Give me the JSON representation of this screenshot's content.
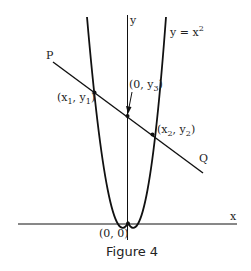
{
  "figure": {
    "caption": "Figure 4",
    "curve_label": "y = x",
    "curve_label_exp": "2",
    "axis_x_label": "x",
    "axis_y_label": "y",
    "line_start_label": "P",
    "line_end_label": "Q",
    "origin_label": "(0, 0)",
    "point1_label": {
      "pre": "(x",
      "sub1": "1",
      "mid": ", y",
      "sub2": "1",
      "post": ")"
    },
    "point2_label": {
      "pre": "(x",
      "sub1": "2",
      "mid": ", y",
      "sub2": "2",
      "post": ")"
    },
    "point3_label": {
      "pre": "(0, y",
      "sub1": "3",
      "post": ")"
    },
    "colors": {
      "stroke": "#111111",
      "background": "#ffffff"
    }
  }
}
